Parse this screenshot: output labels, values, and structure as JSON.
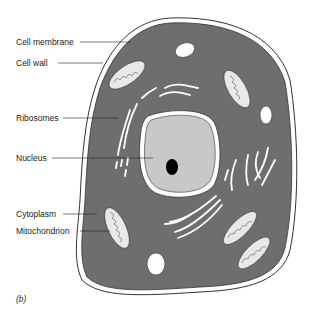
{
  "diagram": {
    "caption": "(b)",
    "labels": [
      {
        "id": "cell-membrane",
        "text": "Cell membrane"
      },
      {
        "id": "cell-wall",
        "text": "Cell wall"
      },
      {
        "id": "ribosomes",
        "text": "Ribosomes"
      },
      {
        "id": "nucleus",
        "text": "Nucleus"
      },
      {
        "id": "cytoplasm",
        "text": "Cytoplasm"
      },
      {
        "id": "mitochondrion",
        "text": "Mitochondrion"
      }
    ],
    "colors": {
      "cytoplasm": "#6e6e6e",
      "nucleus": "#c8c8c8",
      "nucleolus": "#000000",
      "outline": "#333333",
      "wall": "#ffffff"
    }
  }
}
